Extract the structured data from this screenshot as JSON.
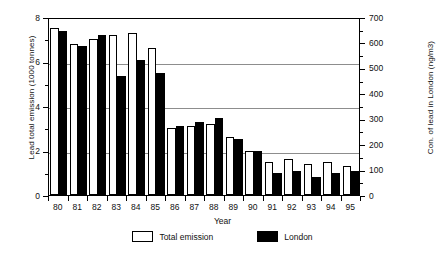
{
  "chart_data": {
    "type": "bar",
    "title": "",
    "xlabel": "Year",
    "ylabel": "Lead total emission (1000 tonnes)",
    "y2label": "Con. of lead in London (ng/m3)",
    "categories": [
      "80",
      "81",
      "82",
      "83",
      "84",
      "85",
      "86",
      "87",
      "88",
      "89",
      "90",
      "91",
      "92",
      "93",
      "94",
      "95"
    ],
    "series": [
      {
        "name": "Total emission",
        "color": "#ffffff",
        "values": [
          7.5,
          6.8,
          7.0,
          7.2,
          7.3,
          6.6,
          3.0,
          3.1,
          3.2,
          2.6,
          2.0,
          1.5,
          1.6,
          1.4,
          1.5,
          1.3
        ]
      },
      {
        "name": "London",
        "color": "#000000",
        "values": [
          7.35,
          6.7,
          7.2,
          5.35,
          6.05,
          5.5,
          3.1,
          3.3,
          3.45,
          2.5,
          2.0,
          1.0,
          1.1,
          0.8,
          1.0,
          1.1
        ]
      }
    ],
    "ylim": [
      0,
      8
    ],
    "yticks": [
      0,
      2,
      4,
      6,
      8
    ],
    "yminorticks": [
      1,
      3,
      5,
      7
    ],
    "y2lim": [
      0,
      700
    ],
    "y2ticks": [
      0,
      100,
      200,
      300,
      400,
      500,
      600,
      700
    ],
    "y2minorticks": [
      50,
      150,
      250,
      350,
      450,
      550,
      650
    ],
    "grid": true,
    "gridlines": [
      2,
      4,
      6
    ],
    "legend_position": "bottom"
  },
  "legend": {
    "total_label": "Total emission",
    "london_label": "London"
  },
  "axes": {
    "ylabel_left": "Lead total emission (1000 tonnes)",
    "ylabel_right": "Con. of lead in London (ng/m3)",
    "xlabel": "Year"
  }
}
